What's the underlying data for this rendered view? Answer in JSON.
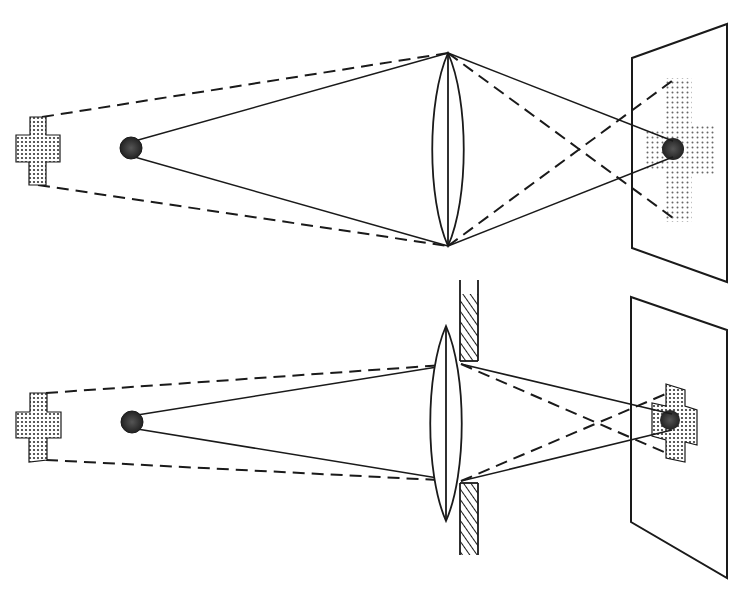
{
  "diagram": {
    "title": "",
    "description": "Lens image formation: wide aperture vs. stopped-down aperture (diaphragm) — depth of field",
    "colors": {
      "ink": "#1a1a1a",
      "paper": "#ffffff",
      "stipple": "#555555",
      "dark_dot": "#333333"
    },
    "panels": [
      {
        "id": "top",
        "caption": "",
        "objects": [
          {
            "type": "cross",
            "role": "far object",
            "cx": 38,
            "cy": 151
          },
          {
            "type": "ball",
            "role": "near object",
            "cx": 131,
            "cy": 148,
            "r": 11
          }
        ],
        "lens": {
          "cx": 448,
          "top": 53,
          "bottom": 246,
          "half_width": 16
        },
        "aperture": "open",
        "screen": {
          "points": [
            [
              632,
              58
            ],
            [
              727,
              24
            ],
            [
              727,
              282
            ],
            [
              632,
              248
            ]
          ]
        },
        "image": {
          "blurred_cross": true,
          "sharp_ball": true
        }
      },
      {
        "id": "bottom",
        "caption": "",
        "objects": [
          {
            "type": "cross",
            "role": "far object",
            "cx": 38,
            "cy": 423
          },
          {
            "type": "ball",
            "role": "near object",
            "cx": 131,
            "cy": 422,
            "r": 11
          }
        ],
        "lens": {
          "cx": 446,
          "top": 326,
          "bottom": 521,
          "half_width": 16
        },
        "aperture": "stopped-down (diaphragm)",
        "screen": {
          "points": [
            [
              631,
              297
            ],
            [
              727,
              330
            ],
            [
              727,
              578
            ],
            [
              631,
              522
            ]
          ]
        },
        "image": {
          "blurred_cross": false,
          "sharp_ball": true
        }
      }
    ]
  }
}
